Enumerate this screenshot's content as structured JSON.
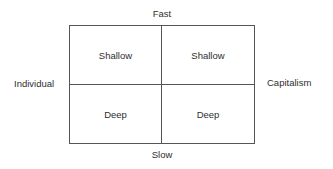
{
  "diagram": {
    "type": "2x2 matrix",
    "axes": {
      "top": "Fast",
      "bottom": "Slow",
      "left": "Individual",
      "right": "Capitalism"
    },
    "quadrants": [
      {
        "position": "top-left",
        "label": "Shallow"
      },
      {
        "position": "top-right",
        "label": "Shallow"
      },
      {
        "position": "bottom-left",
        "label": "Deep"
      },
      {
        "position": "bottom-right",
        "label": "Deep"
      }
    ],
    "colors": {
      "line": "#555555",
      "text": "#2e2e2e",
      "background": "#ffffff"
    }
  }
}
